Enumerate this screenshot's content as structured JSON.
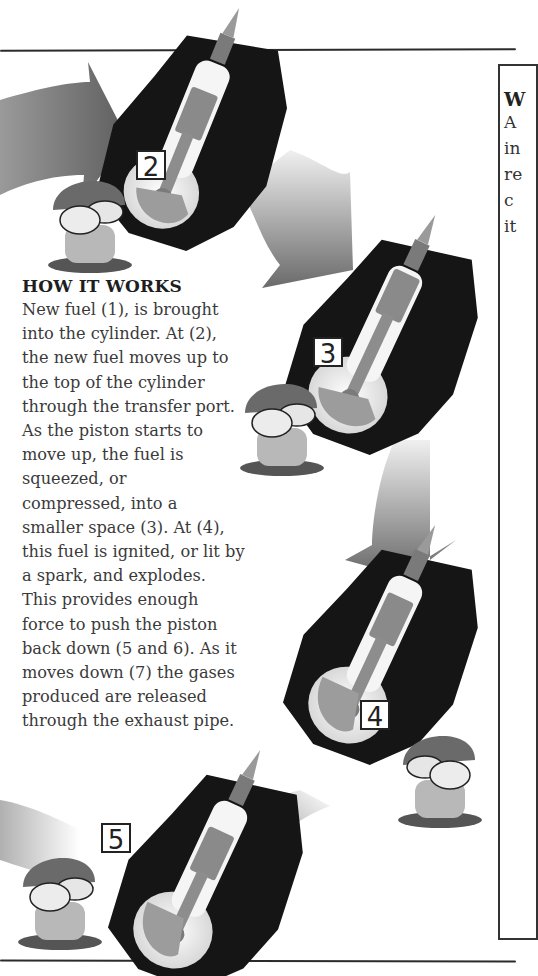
{
  "page": {
    "type": "scanned book page",
    "palette": {
      "ink": "#222222",
      "text": "#3a3a3a",
      "metal": "#8a8a8a",
      "background": "#ffffff"
    }
  },
  "sidebar": {
    "title_fragment": "W",
    "line_fragments": [
      "A",
      "in",
      "re",
      "c",
      "it"
    ]
  },
  "how_it_works": {
    "heading": "HOW IT WORKS",
    "lines": [
      "New fuel (1), is brought",
      "into the cylinder. At (2),",
      "the new fuel moves up to",
      "the top of the cylinder",
      "through the transfer port.",
      "As the piston starts to",
      "move up, the fuel is",
      "squeezed, or",
      "compressed, into a",
      "smaller space (3). At (4),",
      "this fuel is ignited, or lit by",
      "a spark, and explodes.",
      "This provides enough",
      "force to push the piston",
      "back down (5 and 6). As it",
      "moves down (7) the gases",
      "produced are released",
      "through the exhaust pipe."
    ]
  },
  "illustrations": [
    {
      "name": "engine-stage-2",
      "card_label": "2",
      "icon": "two-stroke-engine-cutaway"
    },
    {
      "name": "engine-stage-3",
      "card_label": "3",
      "icon": "two-stroke-engine-cutaway"
    },
    {
      "name": "engine-stage-4",
      "card_label": "4",
      "icon": "two-stroke-engine-cutaway"
    },
    {
      "name": "engine-stage-5",
      "card_label": "5",
      "icon": "two-stroke-engine-cutaway"
    }
  ]
}
